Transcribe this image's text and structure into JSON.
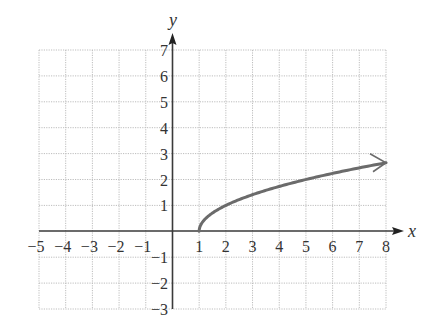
{
  "chart_data": {
    "type": "line",
    "title": "",
    "xlabel": "x",
    "ylabel": "y",
    "xlim": [
      -5,
      8
    ],
    "ylim": [
      -3,
      7
    ],
    "grid": true,
    "grid_style": "dotted",
    "x_ticks": [
      "-5",
      "-4",
      "-3",
      "-2",
      "-1",
      "1",
      "2",
      "3",
      "4",
      "5",
      "6",
      "7",
      "8"
    ],
    "y_ticks": [
      "7",
      "6",
      "5",
      "4",
      "3",
      "2",
      "1",
      "-1",
      "-2",
      "-3"
    ],
    "series": [
      {
        "name": "y = sqrt(x - 1)",
        "color": "#6b6b6b",
        "start_point": "closed-start at (1, 0)",
        "end": "arrow at x = 8",
        "x": [
          1,
          1.25,
          2,
          3,
          4,
          5,
          6,
          7,
          8
        ],
        "y": [
          0,
          0.5,
          1,
          1.41,
          1.73,
          2,
          2.24,
          2.45,
          2.65
        ]
      }
    ]
  },
  "labels": {
    "x_axis": "x",
    "y_axis": "y"
  },
  "colors": {
    "axis": "#3a3a3a",
    "grid": "#bdbdbd",
    "curve": "#6b6b6b",
    "text": "#333333"
  }
}
